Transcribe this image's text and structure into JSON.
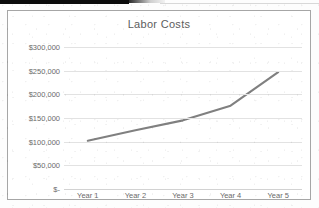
{
  "chart_data": {
    "type": "line",
    "title": "Labor Costs",
    "xlabel": "",
    "ylabel": "",
    "categories": [
      "Year 1",
      "Year 2",
      "Year 3",
      "Year 4",
      "Year 5"
    ],
    "values": [
      102000,
      124000,
      145000,
      176000,
      247000
    ],
    "series": [
      {
        "name": "Labor Costs",
        "values": [
          102000,
          124000,
          145000,
          176000,
          247000
        ]
      }
    ],
    "ylim": [
      0,
      300000
    ],
    "ytick_values": [
      300000,
      250000,
      200000,
      150000,
      100000,
      50000,
      0
    ],
    "ytick_labels": [
      "$300,000",
      "$250,000",
      "$200,000",
      "$150,000",
      "$100,000",
      "$50,000",
      "$-"
    ],
    "grid": "horizontal",
    "legend": "none",
    "line_color": "#808080",
    "gridline_color": "#e2e2e2",
    "text_color": "#6a6a6a",
    "border_color": "#a6a6a6",
    "background_color": "#ffffff"
  }
}
